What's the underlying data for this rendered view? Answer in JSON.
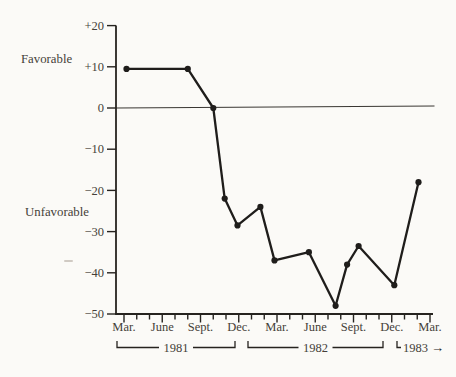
{
  "page": {
    "background": "#fbfaf7"
  },
  "colors": {
    "ink": "#26231f",
    "line": "#1f1d1b",
    "text": "#453f39",
    "zero_line": "#3a3733",
    "artifact": "#b8b1a7"
  },
  "chart_data": {
    "type": "line",
    "title": "",
    "xlabel": "",
    "ylabel": "",
    "ylim": [
      -50,
      20
    ],
    "grid": "zero-line-only",
    "legend": "none",
    "side_labels": {
      "positive": "Favorable",
      "negative": "Unfavorable"
    },
    "y_ticks": [
      {
        "value": 20,
        "label": "+20"
      },
      {
        "value": 10,
        "label": "+10"
      },
      {
        "value": 0,
        "label": "0"
      },
      {
        "value": -10,
        "label": "−10"
      },
      {
        "value": -20,
        "label": "−20"
      },
      {
        "value": -30,
        "label": "−30"
      },
      {
        "value": -40,
        "label": "−40"
      },
      {
        "value": -50,
        "label": "−50"
      }
    ],
    "x_axis": {
      "minor_tick_unit": "month",
      "minor_tick_count": 25,
      "quarter_labels": [
        "Mar.",
        "June",
        "Sept.",
        "Dec.",
        "Mar.",
        "June",
        "Sept.",
        "Dec.",
        "Mar."
      ]
    },
    "year_brackets": [
      {
        "label": "1981"
      },
      {
        "label": "1982"
      },
      {
        "label": "1983",
        "arrow": "→"
      }
    ],
    "series": [
      {
        "name": "net rating",
        "points": [
          {
            "date": "Mar 1981",
            "month_index": 0.2,
            "value": 9.5
          },
          {
            "date": "Aug 1981",
            "month_index": 5.0,
            "value": 9.5
          },
          {
            "date": "Oct 1981",
            "month_index": 7.0,
            "value": 0
          },
          {
            "date": "Nov 1981",
            "month_index": 7.9,
            "value": -22
          },
          {
            "date": "Dec 1981",
            "month_index": 8.9,
            "value": -28.5
          },
          {
            "date": "Jan 1982",
            "month_index": 10.7,
            "value": -24
          },
          {
            "date": "Mar 1982",
            "month_index": 11.8,
            "value": -37
          },
          {
            "date": "May 1982",
            "month_index": 14.5,
            "value": -35
          },
          {
            "date": "Jul 1982",
            "month_index": 16.6,
            "value": -48
          },
          {
            "date": "Aug 1982",
            "month_index": 17.5,
            "value": -38
          },
          {
            "date": "Sep 1982",
            "month_index": 18.4,
            "value": -33.5
          },
          {
            "date": "Dec 1982",
            "month_index": 21.2,
            "value": -43
          },
          {
            "date": "Mar 1983",
            "month_index": 23.1,
            "value": -18
          }
        ]
      }
    ]
  }
}
